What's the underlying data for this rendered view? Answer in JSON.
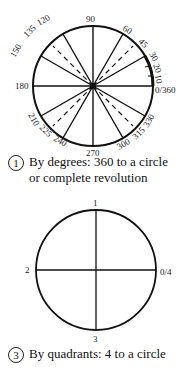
{
  "figure1": {
    "angle_labels": {
      "a0": "0/360",
      "a10": "10",
      "a20": "20",
      "a30": "30",
      "a45": "45",
      "a60": "60",
      "a90": "90",
      "a120": "120",
      "a135": "135",
      "a150": "150",
      "a180": "180",
      "a210": "210",
      "a225": "225",
      "a240": "240",
      "a270": "270",
      "a300": "300",
      "a315": "315",
      "a330": "330"
    },
    "caption_number": "1",
    "caption_line1": "By degrees: 360 to a circle",
    "caption_line2": "or complete revolution"
  },
  "figure3": {
    "quadrant_labels": {
      "q0": "0/4",
      "q1": "1",
      "q2": "2",
      "q3": "3"
    },
    "caption_number": "3",
    "caption_line1": "By quadrants: 4 to a circle"
  }
}
